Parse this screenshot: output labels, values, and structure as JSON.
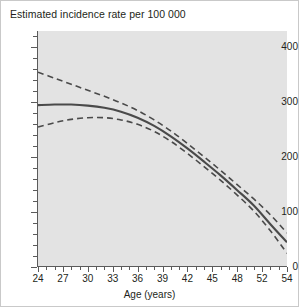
{
  "chart_data": {
    "type": "line",
    "title": "Estimated incidence rate per 100 000",
    "xlabel": "Age (years)",
    "ylabel": "",
    "xlim": [
      24,
      54
    ],
    "ylim": [
      0,
      430
    ],
    "grid": false,
    "legend": "none",
    "x_ticks": [
      24,
      27,
      30,
      33,
      36,
      39,
      42,
      45,
      48,
      51,
      54
    ],
    "x_tick_labels": [
      "24",
      "27",
      "30",
      "33",
      "36",
      "39",
      "42",
      "45",
      "48",
      "52",
      "54"
    ],
    "x_minor_step": 1,
    "y_ticks": [
      0,
      100,
      200,
      300,
      400
    ],
    "y_tick_labels": [
      "0",
      "100",
      "200",
      "300",
      "400"
    ],
    "y_minor_step": 20,
    "x": [
      24,
      26,
      28,
      30,
      32,
      34,
      36,
      38,
      40,
      42,
      44,
      46,
      48,
      50,
      52,
      54
    ],
    "series": [
      {
        "name": "Estimated incidence rate",
        "style": "solid",
        "color": "#4a4a4a",
        "values": [
          295,
          296,
          296,
          294,
          290,
          283,
          272,
          257,
          238,
          216,
          192,
          167,
          140,
          112,
          78,
          45
        ]
      },
      {
        "name": "Upper 95% confidence limit",
        "style": "dashed",
        "color": "#4a4a4a",
        "values": [
          355,
          344,
          333,
          322,
          311,
          299,
          285,
          268,
          248,
          225,
          201,
          176,
          150,
          124,
          95,
          62
        ]
      },
      {
        "name": "Lower 95% confidence limit",
        "style": "dashed",
        "color": "#4a4a4a",
        "values": [
          255,
          263,
          269,
          272,
          272,
          268,
          260,
          247,
          229,
          207,
          183,
          158,
          131,
          102,
          66,
          25
        ]
      }
    ],
    "colors": {
      "plot_background": "#e3e3e3",
      "figure_background": "#ffffff",
      "axis": "#5b5b5b",
      "line": "#4a4a4a",
      "frame": "#c9c9c9"
    }
  }
}
